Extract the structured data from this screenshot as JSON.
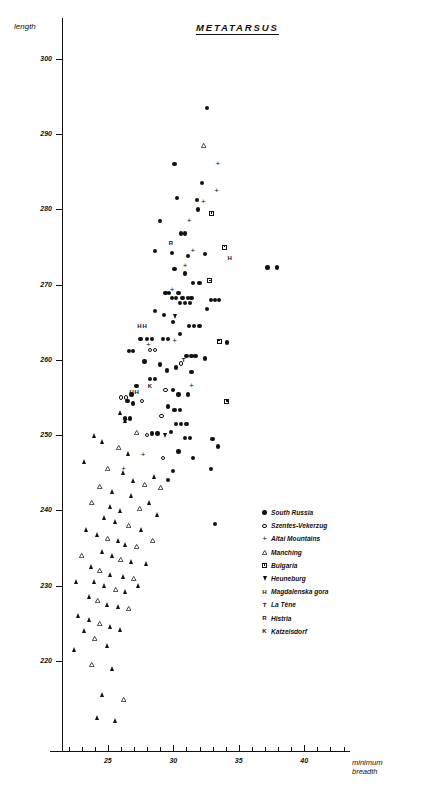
{
  "header": {
    "note": ""
  },
  "footer": {
    "note": ""
  },
  "axes": {
    "y_title": "length",
    "x_title_line1": "minimum",
    "x_title_line2": "breadth"
  },
  "legend": {
    "items": [
      {
        "symbol": "filled-circle",
        "label": "South Russia"
      },
      {
        "symbol": "open-circle",
        "label": "Szentes-Vekerzug"
      },
      {
        "symbol": "plus",
        "label": "Altai Mountains"
      },
      {
        "symbol": "open-triangle",
        "label": "Manching"
      },
      {
        "symbol": "open-square",
        "label": "Bulgaria"
      },
      {
        "symbol": "down-triangle",
        "label": "Heuneburg"
      },
      {
        "symbol": "letter-H",
        "label": "Magdalenska gora"
      },
      {
        "symbol": "letter-T",
        "label": "La Tène"
      },
      {
        "symbol": "letter-R",
        "label": "Histria"
      },
      {
        "symbol": "letter-K",
        "label": "Katzelsdorf"
      }
    ]
  },
  "chart_data": {
    "type": "scatter",
    "title": "METATARSUS",
    "xlabel": "minimum breadth",
    "ylabel": "length",
    "xlim": [
      21.5,
      43.5
    ],
    "ylim": [
      208,
      305
    ],
    "grid": false,
    "legend_position": "center-right",
    "xticks": [
      25,
      30,
      35,
      40
    ],
    "xticks_minor_step": 1,
    "yticks": [
      220,
      230,
      240,
      250,
      260,
      270,
      280,
      290,
      300
    ],
    "series": [
      {
        "name": "South Russia",
        "symbol": "filled-circle",
        "points": [
          [
            32.6,
            293.5
          ],
          [
            32.2,
            283.5
          ],
          [
            30.3,
            281.5
          ],
          [
            31.9,
            280.0
          ],
          [
            29.0,
            278.5
          ],
          [
            30.6,
            276.8
          ],
          [
            30.9,
            276.8
          ],
          [
            31.8,
            281.3
          ],
          [
            37.2,
            272.3
          ],
          [
            37.9,
            272.3
          ],
          [
            30.9,
            271.5
          ],
          [
            31.5,
            270.2
          ],
          [
            32.0,
            270.2
          ],
          [
            30.1,
            272.1
          ],
          [
            29.4,
            268.9
          ],
          [
            29.7,
            268.9
          ],
          [
            30.4,
            268.9
          ],
          [
            29.9,
            268.2
          ],
          [
            30.2,
            268.2
          ],
          [
            30.7,
            268.2
          ],
          [
            31.1,
            268.2
          ],
          [
            31.4,
            268.2
          ],
          [
            30.5,
            267.6
          ],
          [
            30.9,
            267.6
          ],
          [
            31.3,
            267.6
          ],
          [
            32.9,
            268.0
          ],
          [
            33.2,
            268.0
          ],
          [
            33.5,
            268.0
          ],
          [
            28.6,
            266.5
          ],
          [
            29.3,
            266.0
          ],
          [
            32.6,
            266.8
          ],
          [
            30.0,
            265.0
          ],
          [
            31.2,
            264.5
          ],
          [
            31.6,
            264.5
          ],
          [
            32.0,
            264.5
          ],
          [
            30.5,
            263.4
          ],
          [
            27.5,
            262.8
          ],
          [
            28.0,
            262.8
          ],
          [
            28.4,
            262.8
          ],
          [
            29.2,
            262.8
          ],
          [
            29.6,
            262.8
          ],
          [
            34.1,
            262.3
          ],
          [
            26.6,
            261.2
          ],
          [
            26.9,
            261.2
          ],
          [
            31.0,
            260.5
          ],
          [
            31.4,
            260.5
          ],
          [
            31.7,
            260.5
          ],
          [
            32.4,
            260.2
          ],
          [
            29.5,
            258.6
          ],
          [
            28.2,
            257.5
          ],
          [
            28.6,
            257.5
          ],
          [
            27.2,
            256.5
          ],
          [
            26.8,
            255.4
          ],
          [
            26.5,
            254.5
          ],
          [
            26.9,
            254.2
          ],
          [
            30.0,
            256.0
          ],
          [
            30.4,
            255.4
          ],
          [
            31.1,
            255.4
          ],
          [
            29.6,
            253.8
          ],
          [
            30.1,
            253.3
          ],
          [
            30.5,
            253.3
          ],
          [
            26.3,
            252.2
          ],
          [
            26.7,
            252.2
          ],
          [
            30.2,
            251.5
          ],
          [
            30.6,
            251.5
          ],
          [
            31.0,
            251.5
          ],
          [
            29.8,
            250.4
          ],
          [
            30.9,
            249.6
          ],
          [
            31.3,
            249.6
          ],
          [
            33.0,
            249.5
          ],
          [
            33.4,
            248.5
          ],
          [
            32.9,
            245.5
          ],
          [
            28.4,
            250.2
          ],
          [
            28.8,
            250.2
          ],
          [
            33.2,
            238.2
          ],
          [
            28.6,
            274.5
          ],
          [
            29.9,
            274.2
          ],
          [
            31.1,
            273.8
          ],
          [
            32.4,
            274.1
          ],
          [
            30.1,
            286.0
          ],
          [
            27.8,
            259.8
          ],
          [
            29.0,
            259.4
          ],
          [
            30.2,
            259.0
          ],
          [
            31.4,
            258.4
          ],
          [
            30.4,
            247.8
          ],
          [
            31.5,
            247.0
          ],
          [
            30.0,
            245.2
          ],
          [
            29.6,
            244.0
          ]
        ]
      },
      {
        "name": "Szentes-Vekerzug",
        "symbol": "open-circle",
        "points": [
          [
            28.2,
            261.3
          ],
          [
            28.6,
            261.3
          ],
          [
            29.4,
            256.0
          ],
          [
            26.0,
            255.0
          ],
          [
            26.4,
            255.0
          ],
          [
            29.1,
            252.5
          ],
          [
            28.0,
            250.0
          ],
          [
            29.2,
            247.0
          ],
          [
            27.6,
            254.5
          ],
          [
            30.6,
            259.5
          ]
        ]
      },
      {
        "name": "Altai Mountains",
        "symbol": "plus",
        "points": [
          [
            33.3,
            282.5
          ],
          [
            32.3,
            281.0
          ],
          [
            31.2,
            278.5
          ],
          [
            30.9,
            272.5
          ],
          [
            31.5,
            274.5
          ],
          [
            29.9,
            269.3
          ],
          [
            28.1,
            262.0
          ],
          [
            31.4,
            256.5
          ],
          [
            30.1,
            262.5
          ],
          [
            26.4,
            252.0
          ],
          [
            27.7,
            247.3
          ],
          [
            33.4,
            286.0
          ],
          [
            26.2,
            245.5
          ]
        ]
      },
      {
        "name": "Manching",
        "symbol": "open-triangle",
        "points": [
          [
            32.3,
            288.5
          ],
          [
            26.0,
            253.0
          ],
          [
            26.4,
            252.0
          ],
          [
            27.2,
            250.3
          ],
          [
            24.0,
            250.0
          ],
          [
            24.6,
            249.2
          ],
          [
            25.8,
            248.3
          ],
          [
            26.6,
            247.5
          ],
          [
            23.2,
            246.5
          ],
          [
            25.0,
            245.5
          ],
          [
            26.2,
            245.0
          ],
          [
            27.0,
            244.0
          ],
          [
            24.4,
            243.2
          ],
          [
            25.4,
            242.5
          ],
          [
            26.8,
            242.0
          ],
          [
            23.8,
            241.0
          ],
          [
            25.2,
            240.5
          ],
          [
            26.0,
            240.0
          ],
          [
            27.4,
            240.2
          ],
          [
            24.8,
            239.0
          ],
          [
            25.6,
            238.5
          ],
          [
            26.6,
            238.0
          ],
          [
            23.4,
            237.5
          ],
          [
            24.2,
            236.8
          ],
          [
            25.0,
            236.2
          ],
          [
            25.8,
            236.0
          ],
          [
            26.4,
            235.5
          ],
          [
            27.2,
            235.2
          ],
          [
            24.6,
            234.5
          ],
          [
            25.4,
            234.0
          ],
          [
            26.0,
            233.5
          ],
          [
            26.8,
            233.2
          ],
          [
            23.8,
            232.5
          ],
          [
            24.4,
            232.0
          ],
          [
            25.2,
            231.5
          ],
          [
            26.2,
            231.2
          ],
          [
            27.0,
            231.0
          ],
          [
            24.0,
            230.5
          ],
          [
            24.8,
            230.0
          ],
          [
            25.6,
            229.5
          ],
          [
            26.4,
            229.2
          ],
          [
            23.6,
            228.5
          ],
          [
            24.2,
            228.0
          ],
          [
            25.0,
            227.5
          ],
          [
            25.8,
            227.2
          ],
          [
            26.6,
            227.0
          ],
          [
            22.8,
            226.0
          ],
          [
            23.6,
            225.5
          ],
          [
            24.4,
            225.0
          ],
          [
            25.2,
            224.5
          ],
          [
            26.0,
            224.2
          ],
          [
            24.0,
            223.0
          ],
          [
            25.0,
            222.0
          ],
          [
            22.5,
            221.5
          ],
          [
            23.8,
            219.5
          ],
          [
            25.4,
            219.0
          ],
          [
            24.6,
            215.5
          ],
          [
            26.2,
            214.8
          ],
          [
            24.2,
            212.5
          ],
          [
            25.6,
            212.0
          ],
          [
            27.8,
            243.5
          ],
          [
            28.2,
            241.0
          ],
          [
            27.6,
            237.5
          ],
          [
            28.4,
            236.0
          ],
          [
            28.0,
            233.0
          ],
          [
            27.4,
            230.0
          ],
          [
            23.0,
            234.0
          ],
          [
            22.6,
            230.5
          ],
          [
            28.6,
            244.5
          ],
          [
            29.0,
            243.0
          ],
          [
            28.8,
            239.5
          ],
          [
            23.2,
            224.0
          ]
        ]
      },
      {
        "name": "Bulgaria",
        "symbol": "open-square",
        "points": [
          [
            32.9,
            279.5
          ],
          [
            33.9,
            275.0
          ],
          [
            32.8,
            270.5
          ],
          [
            33.5,
            262.5
          ],
          [
            34.1,
            254.5
          ]
        ]
      },
      {
        "name": "Heuneburg",
        "symbol": "down-triangle",
        "points": [
          [
            30.2,
            265.8
          ],
          [
            29.4,
            250.0
          ]
        ]
      },
      {
        "name": "Magdalenska gora",
        "symbol": "letter-H",
        "points": [
          [
            34.3,
            273.5
          ],
          [
            27.4,
            264.5
          ],
          [
            27.8,
            264.5
          ],
          [
            26.8,
            255.8
          ],
          [
            27.2,
            255.8
          ]
        ]
      },
      {
        "name": "La Tène",
        "symbol": "letter-T",
        "points": [
          [
            30.8,
            260.0
          ]
        ]
      },
      {
        "name": "Histria",
        "symbol": "letter-R",
        "points": [
          [
            29.8,
            275.5
          ]
        ]
      },
      {
        "name": "Katzelsdorf",
        "symbol": "letter-K",
        "points": [
          [
            28.2,
            256.5
          ]
        ]
      }
    ]
  }
}
